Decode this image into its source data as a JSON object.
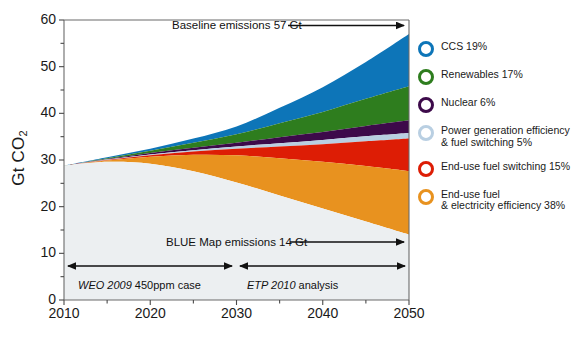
{
  "chart_data": {
    "type": "area",
    "title": "",
    "xlabel": "",
    "ylabel": "Gt CO2",
    "ylabel_display": "Gt CO",
    "ylabel_sub": "2",
    "xlim": [
      2010,
      2050
    ],
    "ylim": [
      0,
      60
    ],
    "y_ticks": [
      0,
      10,
      20,
      30,
      40,
      50,
      60
    ],
    "y_minor_ticks": [
      5,
      15,
      25,
      35,
      45,
      55
    ],
    "x_ticks": [
      2010,
      2020,
      2030,
      2040,
      2050
    ],
    "grid": false,
    "legend_position": "right",
    "x": [
      2010,
      2015,
      2020,
      2025,
      2030,
      2035,
      2040,
      2045,
      2050
    ],
    "baseline_total": [
      28.8,
      30.6,
      32.4,
      34.6,
      37.2,
      41.2,
      45.6,
      51.0,
      57.0
    ],
    "blue_map_bottom": [
      28.8,
      29.6,
      29.2,
      27.6,
      25.2,
      22.4,
      19.6,
      16.8,
      14.0
    ],
    "series": [
      {
        "name": "CCS",
        "share_label": "CCS 19%",
        "share_pct": 19,
        "color": "#0d75b8",
        "cumulative_top": [
          28.8,
          30.6,
          32.4,
          34.6,
          37.2,
          41.2,
          45.6,
          51.0,
          57.0
        ]
      },
      {
        "name": "Renewables",
        "share_label": "Renewables 17%",
        "share_pct": 17,
        "color": "#2e7d1e",
        "cumulative_top": [
          28.8,
          30.4,
          32.0,
          33.7,
          35.5,
          37.9,
          40.3,
          43.1,
          45.8
        ]
      },
      {
        "name": "Nuclear",
        "share_label": "Nuclear 6%",
        "share_pct": 6,
        "color": "#3d0a4a",
        "cumulative_top": [
          28.8,
          30.2,
          31.5,
          32.6,
          33.7,
          34.9,
          36.0,
          37.3,
          38.5
        ]
      },
      {
        "name": "Power generation efficiency & fuel switching",
        "share_label": "Power generation efficiency\n& fuel switching 5%",
        "share_pct": 5,
        "color": "#b9cfe2",
        "cumulative_top": [
          28.8,
          30.1,
          31.2,
          32.1,
          32.9,
          33.6,
          34.3,
          35.1,
          35.8
        ]
      },
      {
        "name": "End-use fuel switching",
        "share_label": "End-use fuel switching 15%",
        "share_pct": 15,
        "color": "#dd1d05",
        "cumulative_top": [
          28.8,
          30.0,
          31.0,
          31.8,
          32.4,
          32.9,
          33.4,
          34.0,
          34.6
        ]
      },
      {
        "name": "End-use fuel & electricity efficiency",
        "share_label": "End-use fuel\n& electricity efficiency 38%",
        "share_pct": 38,
        "color": "#e8921f",
        "cumulative_top": [
          28.8,
          29.9,
          30.7,
          31.1,
          31.0,
          30.4,
          29.6,
          28.7,
          27.6
        ]
      }
    ],
    "annotations": [
      {
        "id": "baseline",
        "text": "Baseline emissions 57 Gt",
        "value": 57,
        "unit": "Gt"
      },
      {
        "id": "blue_map",
        "text": "BLUE Map emissions 14 Gt",
        "value": 14,
        "unit": "Gt"
      }
    ],
    "periods": [
      {
        "id": "weo",
        "italic": "WEO 2009",
        "rest": " 450ppm case",
        "from": 2010,
        "to": 2030
      },
      {
        "id": "etp",
        "italic": "ETP 2010",
        "rest": " analysis",
        "from": 2030,
        "to": 2050
      }
    ]
  },
  "axis": {
    "y_title_main": "Gt CO",
    "y_title_sub": "2",
    "y_labels": [
      "60",
      "50",
      "40",
      "30",
      "20",
      "10",
      "0"
    ],
    "x_labels": [
      "2010",
      "2020",
      "2030",
      "2040",
      "2050"
    ]
  },
  "annotations": {
    "baseline": "Baseline emissions 57 Gt",
    "blue_map": "BLUE Map emissions 14 Gt"
  },
  "periods": {
    "weo_italic": "WEO 2009",
    "weo_rest": " 450ppm case",
    "etp_italic": "ETP 2010",
    "etp_rest": " analysis"
  },
  "legend": {
    "items": [
      {
        "label": "CCS 19%",
        "color": "#0d75b8",
        "name": "ccs"
      },
      {
        "label": "Renewables 17%",
        "color": "#2e7d1e",
        "name": "renewables"
      },
      {
        "label": "Nuclear 6%",
        "color": "#3d0a4a",
        "name": "nuclear"
      },
      {
        "label": "Power generation efficiency\n& fuel switching 5%",
        "color": "#b9cfe2",
        "name": "power-generation-efficiency"
      },
      {
        "label": "End-use fuel switching 15%",
        "color": "#dd1d05",
        "name": "end-use-fuel-switching"
      },
      {
        "label": "End-use fuel\n& electricity efficiency 38%",
        "color": "#e8921f",
        "name": "end-use-fuel-electricity-efficiency"
      }
    ]
  }
}
